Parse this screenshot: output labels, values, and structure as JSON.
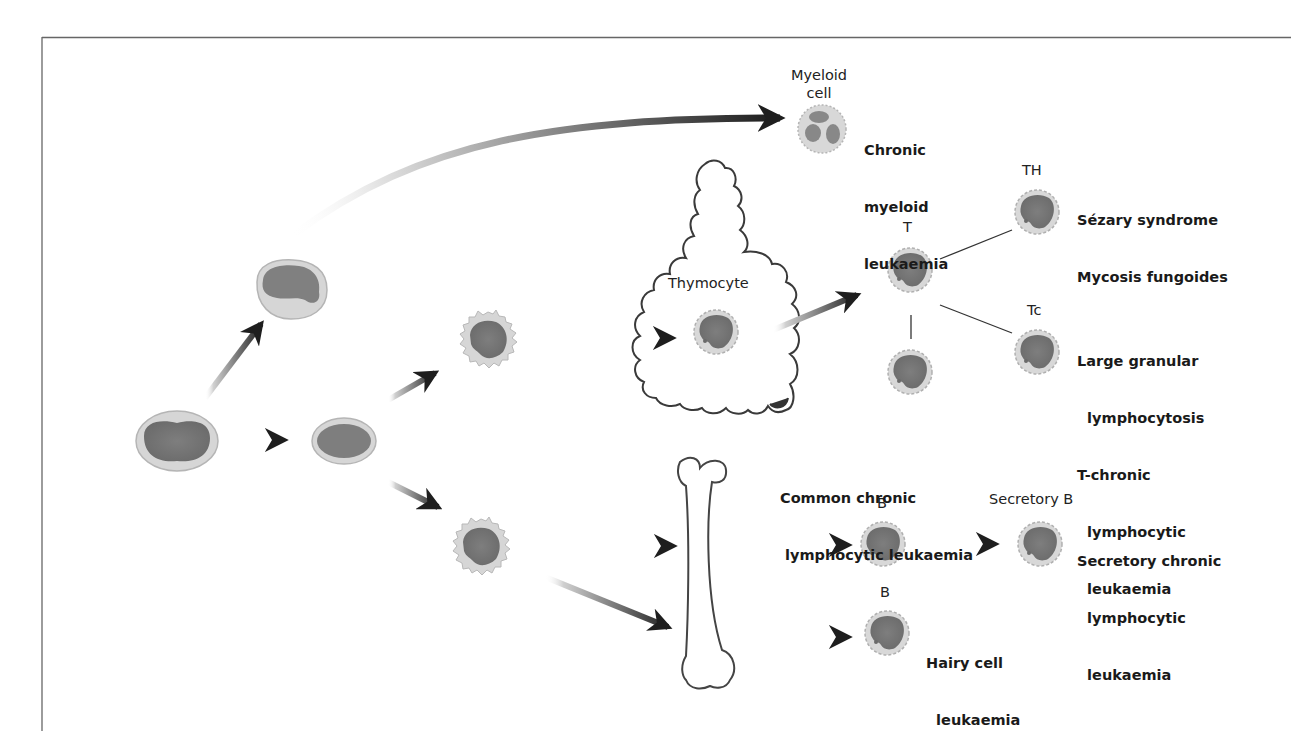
{
  "figure": {
    "title": "",
    "frame": {
      "top_y": 37,
      "left_x": 42,
      "border_color": "#555555"
    },
    "colors": {
      "nucleus": "#7a7a7a",
      "cytoplasm": "#d6d6d6",
      "cell_outline": "#b5b5b5",
      "arrow_dark": "#1e1e1e",
      "arrow_light": "#e8e8e8",
      "outline": "#444444"
    }
  },
  "cells": {
    "stem_cell": {
      "label": ""
    },
    "lymphoid_progenitor": {
      "label": ""
    },
    "myeloid_progenitor": {
      "label": ""
    },
    "myeloid_cell": {
      "label": "Myeloid\ncell",
      "line1": "Myeloid",
      "line2": "cell"
    },
    "pre_t_cell": {
      "label": ""
    },
    "pre_b_cell": {
      "label": ""
    },
    "thymocyte": {
      "label": "Thymocyte"
    },
    "t_cell": {
      "label": "T"
    },
    "th_cell": {
      "label": "TH"
    },
    "tc_cell": {
      "label": "Tc"
    },
    "t_other_cell": {
      "label": ""
    },
    "b_cell_common": {
      "label": "B"
    },
    "b_cell_hairy": {
      "label": "B"
    },
    "secretory_b_cell": {
      "label": "Secretory B"
    }
  },
  "organs": {
    "thymus": {
      "label": ""
    },
    "bone_marrow": {
      "label": ""
    }
  },
  "diseases": {
    "cml": {
      "lines": [
        "Chronic",
        "myeloid",
        "leukaemia"
      ]
    },
    "th": {
      "lines": [
        "Sézary syndrome",
        "Mycosis fungoides"
      ]
    },
    "tc": {
      "lines": [
        "Large granular",
        "  lymphocytosis",
        "T-chronic",
        "  lymphocytic",
        "  leukaemia"
      ]
    },
    "common_cll": {
      "lines": [
        "Common chronic",
        " lymphocytic leukaemia"
      ]
    },
    "secretory_cll": {
      "lines": [
        "Secretory chronic",
        "  lymphocytic",
        "  leukaemia"
      ]
    },
    "hairy_cell": {
      "lines": [
        "Hairy cell",
        "  leukaemia"
      ]
    }
  }
}
